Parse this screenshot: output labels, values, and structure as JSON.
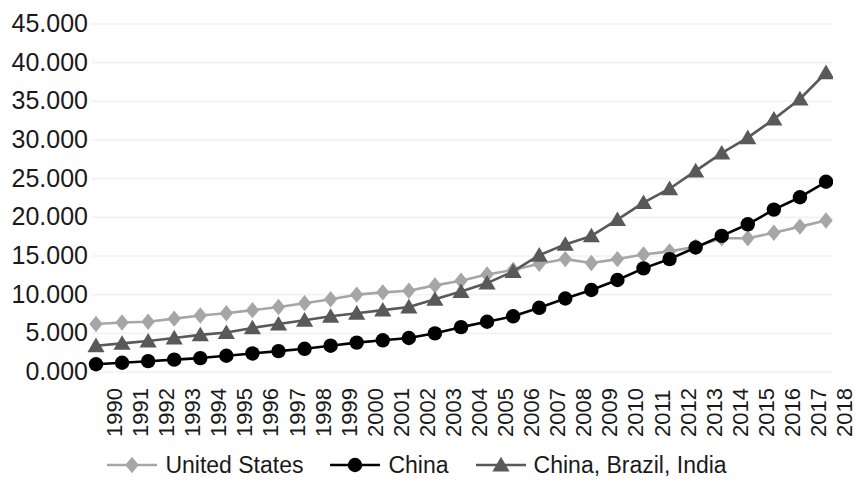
{
  "chart_data": {
    "type": "line",
    "title": "",
    "subtitle": "",
    "xlabel": "",
    "ylabel": "",
    "grid": true,
    "legend_position": "bottom",
    "ylim": [
      0,
      45
    ],
    "ytick_labels": [
      "0.000",
      "5.000",
      "10.000",
      "15.000",
      "20.000",
      "25.000",
      "30.000",
      "35.000",
      "40.000",
      "45.000"
    ],
    "ytick_values": [
      0,
      5,
      10,
      15,
      20,
      25,
      30,
      35,
      40,
      45
    ],
    "categories": [
      "1990",
      "1991",
      "1992",
      "1993",
      "1994",
      "1995",
      "1996",
      "1997",
      "1998",
      "1999",
      "2000",
      "2001",
      "2002",
      "2003",
      "2004",
      "2005",
      "2006",
      "2007",
      "2008",
      "2009",
      "2010",
      "2011",
      "2012",
      "2013",
      "2014",
      "2015",
      "2016",
      "2017",
      "2018"
    ],
    "x": [
      1990,
      1991,
      1992,
      1993,
      1994,
      1995,
      1996,
      1997,
      1998,
      1999,
      2000,
      2001,
      2002,
      2003,
      2004,
      2005,
      2006,
      2007,
      2008,
      2009,
      2010,
      2011,
      2012,
      2013,
      2014,
      2015,
      2016,
      2017,
      2018
    ],
    "series": [
      {
        "name": "United States",
        "color": "#a6a6a6",
        "marker": "diamond",
        "values": [
          6.2,
          6.4,
          6.5,
          6.9,
          7.3,
          7.6,
          8.0,
          8.4,
          8.9,
          9.4,
          10.0,
          10.3,
          10.5,
          11.2,
          11.8,
          12.6,
          13.2,
          14.0,
          14.6,
          14.1,
          14.6,
          15.2,
          15.6,
          16.2,
          17.3,
          17.3,
          18.0,
          18.8,
          19.6
        ]
      },
      {
        "name": "China",
        "color": "#000000",
        "marker": "circle",
        "values": [
          1.0,
          1.2,
          1.4,
          1.6,
          1.8,
          2.1,
          2.4,
          2.7,
          3.0,
          3.4,
          3.8,
          4.1,
          4.4,
          5.0,
          5.8,
          6.5,
          7.2,
          8.3,
          9.5,
          10.6,
          11.9,
          13.4,
          14.6,
          16.1,
          17.6,
          19.1,
          21.0,
          22.6,
          24.6
        ]
      },
      {
        "name": "China, Brazil, India",
        "color": "#595959",
        "marker": "triangle",
        "values": [
          3.4,
          3.7,
          4.0,
          4.4,
          4.8,
          5.1,
          5.7,
          6.2,
          6.7,
          7.2,
          7.6,
          8.0,
          8.4,
          9.4,
          10.4,
          11.5,
          13.0,
          15.1,
          16.5,
          17.6,
          19.7,
          21.9,
          23.7,
          26.0,
          28.3,
          30.3,
          32.7,
          35.3,
          38.7
        ]
      }
    ]
  },
  "legend": {
    "items": [
      {
        "label": "United States"
      },
      {
        "label": "China"
      },
      {
        "label": "China, Brazil, India"
      }
    ]
  }
}
